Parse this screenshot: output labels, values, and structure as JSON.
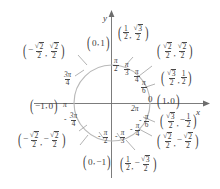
{
  "figure": {
    "name": "unit-circle",
    "axes": {
      "x_label": "x",
      "y_label": "y",
      "origin_label": "0"
    },
    "colors": {
      "circle_stroke": "#b9b9b9",
      "axis_stroke": "#6d6d6d",
      "text": "#3d3d3d",
      "leader_line": "#9a9a9a",
      "background": "#ffffff"
    },
    "geometry": {
      "center_x": 112,
      "center_y": 103,
      "radius": 38
    }
  },
  "axis_points": {
    "right": "(1, 0)",
    "top": "(0, 1)",
    "left": "(-1, 0)",
    "bottom": "(0, -1)"
  },
  "angles": [
    {
      "id": "zero",
      "text": "0",
      "degrees": 0
    },
    {
      "id": "two-pi",
      "text": "2π",
      "degrees": 360
    },
    {
      "id": "pi-over-6",
      "num": "π",
      "den": "6",
      "degrees": 30
    },
    {
      "id": "pi-over-4",
      "num": "π",
      "den": "4",
      "degrees": 45
    },
    {
      "id": "pi-over-3",
      "num": "π",
      "den": "3",
      "degrees": 60
    },
    {
      "id": "pi-over-2",
      "num": "π",
      "den": "2",
      "degrees": 90
    },
    {
      "id": "three-pi-over-4",
      "num": "3π",
      "den": "4",
      "degrees": 135
    },
    {
      "id": "pi",
      "text": "π",
      "degrees": 180
    },
    {
      "id": "neg-three-pi-over-4",
      "num": "3π",
      "den": "4",
      "sign": "-",
      "degrees": -135
    },
    {
      "id": "neg-pi-over-2",
      "num": "π",
      "den": "2",
      "sign": "-",
      "degrees": -90
    },
    {
      "id": "neg-pi-over-3",
      "num": "π",
      "den": "3",
      "sign": "-",
      "degrees": -60
    },
    {
      "id": "neg-pi-over-4",
      "num": "π",
      "den": "4",
      "sign": "-",
      "degrees": -45
    },
    {
      "id": "neg-pi-over-6",
      "num": "π",
      "den": "6",
      "sign": "-",
      "degrees": -30
    }
  ],
  "points": [
    {
      "id": "p-30",
      "x_text": "√3/2",
      "y_text": "1/2",
      "quadrant": "I"
    },
    {
      "id": "p-45",
      "x_text": "√2/2",
      "y_text": "√2/2",
      "quadrant": "I"
    },
    {
      "id": "p-60",
      "x_text": "1/2",
      "y_text": "√3/2",
      "quadrant": "I"
    },
    {
      "id": "p-135",
      "x_text": "-√2/2",
      "y_text": "√2/2",
      "quadrant": "II"
    },
    {
      "id": "p-225",
      "x_text": "-√2/2",
      "y_text": "-√2/2",
      "quadrant": "III"
    },
    {
      "id": "p-315",
      "x_text": "√2/2",
      "y_text": "-√2/2",
      "quadrant": "IV"
    },
    {
      "id": "p-330",
      "x_text": "√3/2",
      "y_text": "-1/2",
      "quadrant": "IV"
    },
    {
      "id": "p-300",
      "x_text": "1/2",
      "y_text": "-√3/2",
      "quadrant": "IV"
    }
  ],
  "glyphs": {
    "radical": "√",
    "pi": "π",
    "minus": "−",
    "comma": ",",
    "lparen": "(",
    "rparen": ")",
    "two": "2",
    "three": "3",
    "one": "1",
    "six": "6",
    "four": "4"
  }
}
